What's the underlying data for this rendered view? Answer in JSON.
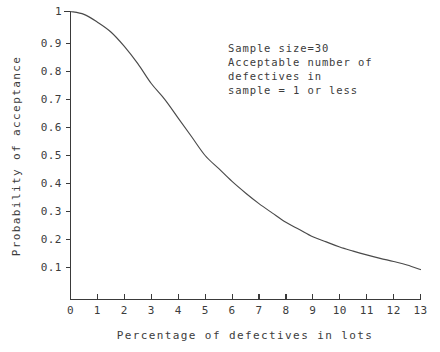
{
  "chart_data": {
    "type": "line",
    "title": "",
    "xlabel": "Percentage of defectives in lots",
    "ylabel": "Probability of acceptance",
    "xlim": [
      0,
      13
    ],
    "ylim": [
      0,
      1
    ],
    "grid": false,
    "legend": null,
    "xticks": [
      0,
      1,
      2,
      3,
      4,
      5,
      6,
      7,
      8,
      9,
      10,
      11,
      12,
      13
    ],
    "xticklabels": [
      "0",
      "1",
      "2",
      "3",
      "4",
      "5",
      "6",
      "7",
      "8",
      "9",
      "10",
      "11",
      "12",
      "13"
    ],
    "yticks": [
      0.1,
      0.2,
      0.3,
      0.4,
      0.5,
      0.6,
      0.7,
      0.8,
      0.9,
      1
    ],
    "yticklabels": [
      "0.1",
      "0.2",
      "0.3",
      "0.4",
      "0.5",
      "0.6",
      "0.7",
      "0.8",
      "0.9",
      "1"
    ],
    "series": [
      {
        "name": "Operating characteristic curve",
        "x": [
          0,
          0.5,
          1,
          1.5,
          2,
          2.5,
          3,
          3.5,
          4,
          4.5,
          5,
          5.5,
          6,
          6.5,
          7,
          7.5,
          8,
          8.5,
          9,
          9.5,
          10,
          10.5,
          11,
          11.5,
          12,
          12.5,
          13
        ],
        "y": [
          1.0,
          0.99,
          0.963,
          0.929,
          0.879,
          0.819,
          0.75,
          0.695,
          0.63,
          0.565,
          0.5,
          0.455,
          0.41,
          0.37,
          0.333,
          0.3,
          0.268,
          0.243,
          0.218,
          0.2,
          0.182,
          0.168,
          0.155,
          0.143,
          0.132,
          0.12,
          0.104
        ]
      }
    ],
    "annotations": [
      {
        "lines": [
          "Sample size=30",
          "Acceptable number of",
          "defectives in",
          "sample = 1 or less"
        ]
      }
    ]
  },
  "annotation": {
    "line1": "Sample size=30",
    "line2": "Acceptable number of",
    "line3": "defectives in",
    "line4": "sample = 1 or less"
  },
  "axes": {
    "x_label": "Percentage of defectives in lots",
    "y_label": "Probability of acceptance"
  },
  "colors": {
    "background": "#ffffff",
    "axis": "#3a3a3a",
    "curve": "#4a4a4a",
    "text": "#3c3c3c"
  }
}
